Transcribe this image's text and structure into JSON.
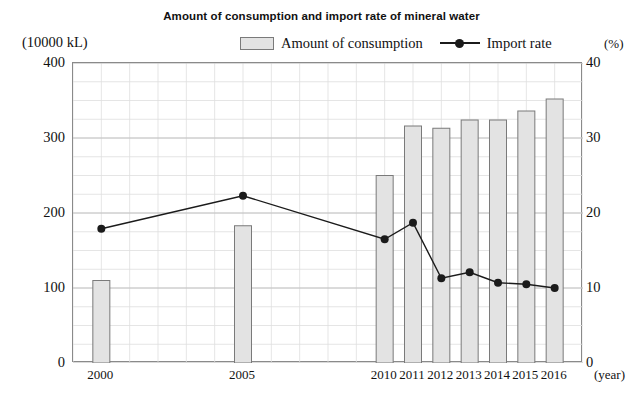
{
  "chart_data": {
    "type": "bar",
    "title": "Amount of consumption and import rate of mineral water",
    "xlabel": "(year)",
    "ylabel": "(10000 kL)",
    "y2label": "(%)",
    "categories": [
      "2000",
      "2005",
      "2010",
      "2011",
      "2012",
      "2013",
      "2014",
      "2015",
      "2016"
    ],
    "x_positions": [
      2000,
      2005,
      2010,
      2011,
      2012,
      2013,
      2014,
      2015,
      2016
    ],
    "x_range": [
      1999,
      2017
    ],
    "ylim": [
      0,
      400
    ],
    "y2lim": [
      0,
      40
    ],
    "yticks": [
      "0",
      "100",
      "200",
      "300",
      "400"
    ],
    "ytick_values": [
      0,
      100,
      200,
      300,
      400
    ],
    "y2ticks": [
      "0",
      "10",
      "20",
      "30",
      "40"
    ],
    "y2tick_values": [
      0,
      10,
      20,
      30,
      40
    ],
    "grid": true,
    "grid_minor_y_step": 25,
    "grid_minor_x_step": 1,
    "legend_position": "top",
    "series": [
      {
        "name": "Amount of consumption",
        "type": "bar",
        "axis": "left",
        "unit": "10000 kL",
        "color": "#e3e3e3",
        "edge_color": "#7a7a7a",
        "values": [
          110,
          183,
          250,
          316,
          313,
          324,
          324,
          336,
          352
        ]
      },
      {
        "name": "Import rate",
        "type": "line",
        "axis": "right",
        "unit": "%",
        "color": "#1b1b1b",
        "marker": "circle",
        "values": [
          17.9,
          22.3,
          16.5,
          18.7,
          11.3,
          12.1,
          10.7,
          10.5,
          10.0
        ]
      }
    ]
  },
  "legend": {
    "bar_label": "Amount of consumption",
    "line_label": "Import rate"
  },
  "axes": {
    "left_unit": "(10000 kL)",
    "right_unit": "(%)",
    "x_unit": "(year)"
  },
  "colors": {
    "bar_fill": "#e3e3e3",
    "bar_edge": "#7a7a7a",
    "line": "#1b1b1b",
    "grid_major": "#bdbdbd",
    "grid_minor": "#dedede",
    "frame": "#8a8a8a",
    "text": "#111111",
    "background": "#ffffff"
  }
}
